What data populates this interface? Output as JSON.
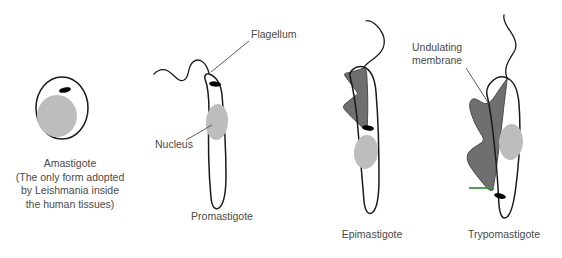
{
  "figure": {
    "background_color": "#ffffff",
    "text_color": "#4a4a4a",
    "outline_color": "#1a1a1a",
    "nucleus_color": "#bdbdbd",
    "membrane_color": "#6f6f6f",
    "kinetoplast_color": "#000000",
    "accent_green": "#3a9b3a"
  },
  "callouts": {
    "flagellum": "Flagellum",
    "nucleus": "Nucleus",
    "undulating_membrane_line1": "Undulating",
    "undulating_membrane_line2": "membrane"
  },
  "forms": [
    {
      "name": "Amastigote",
      "caption_lines": [
        "Amastigote",
        "(The only form adopted",
        "by Leishmania inside",
        "the human tissues)"
      ]
    },
    {
      "name": "Promastigote",
      "caption_lines": [
        "Promastigote"
      ]
    },
    {
      "name": "Epimastigote",
      "caption_lines": [
        "Epimastigote"
      ]
    },
    {
      "name": "Trypomastigote",
      "caption_lines": [
        "Trypomastigote"
      ]
    }
  ],
  "bottom_text": ""
}
